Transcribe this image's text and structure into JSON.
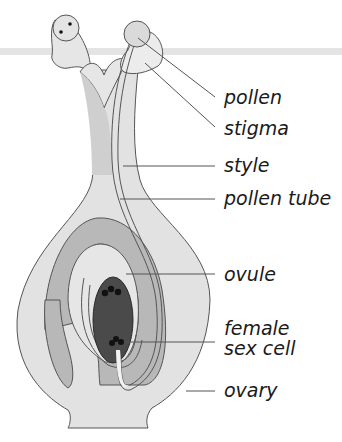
{
  "diagram": {
    "labels": [
      {
        "id": "pollen",
        "text": "pollen"
      },
      {
        "id": "stigma",
        "text": "stigma"
      },
      {
        "id": "style",
        "text": "style"
      },
      {
        "id": "pollen_tube",
        "text": "pollen tube"
      },
      {
        "id": "ovule",
        "text": "ovule"
      },
      {
        "id": "female_sex_cell",
        "line1": "female",
        "line2": "sex cell"
      },
      {
        "id": "ovary",
        "text": "ovary"
      }
    ],
    "colors": {
      "outer_tissue": "#e2e2e2",
      "style_inner": "#cfcfcf",
      "ovule_band": "#b8b8b8",
      "ovule_inner": "#e6e6e6",
      "sex_cell_dark": "#4a4a4a",
      "outline": "#555555",
      "leader_line": "#555555",
      "header_band": "#e4e4e4"
    }
  }
}
